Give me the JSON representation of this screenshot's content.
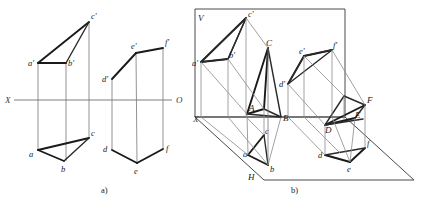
{
  "figure": {
    "caption_a": "a)",
    "caption_b": "b)",
    "axis": {
      "x_label": "X",
      "o_label": "O"
    }
  },
  "panel_a": {
    "name": "orthographic-projection-panel",
    "axis_labels": {
      "left": "X",
      "right": "O"
    },
    "solid_1": {
      "name": "triangular-prism-abc",
      "front_view_labels": [
        "a'",
        "b'",
        "c'"
      ],
      "top_view_labels": [
        "a",
        "b",
        "c"
      ],
      "front_points": {
        "a'": [
          38,
          63
        ],
        "b'": [
          66,
          63
        ],
        "c'": [
          89,
          22
        ]
      },
      "top_points": {
        "a": [
          38,
          150
        ],
        "b": [
          64,
          161
        ],
        "c": [
          89,
          138
        ]
      }
    },
    "solid_2": {
      "name": "triangular-prism-def",
      "front_view_labels": [
        "d'",
        "e'",
        "f'"
      ],
      "top_view_labels": [
        "d",
        "e",
        "f"
      ],
      "front_points": {
        "d'": [
          112,
          79
        ],
        "e'": [
          136,
          53
        ],
        "f'": [
          163,
          48
        ]
      },
      "top_points": {
        "d": [
          112,
          150
        ],
        "e": [
          137,
          163
        ],
        "f": [
          163,
          149
        ]
      }
    }
  },
  "panel_b": {
    "name": "pictorial-projection-panel",
    "plane_labels": {
      "vertical": "V",
      "horizontal": "H",
      "origin_x": "X"
    },
    "solid_1": {
      "name": "triangular-prism-ABC",
      "front_view_labels": [
        "a'",
        "b'",
        "c'"
      ],
      "top_view_labels": [
        "a",
        "b",
        "c"
      ],
      "space_labels": [
        "A",
        "B",
        "C"
      ]
    },
    "solid_2": {
      "name": "triangular-prism-DEF",
      "front_view_labels": [
        "d'",
        "e'",
        "f'"
      ],
      "top_view_labels": [
        "d",
        "e",
        "f"
      ],
      "space_labels": [
        "D",
        "E",
        "F"
      ]
    }
  }
}
